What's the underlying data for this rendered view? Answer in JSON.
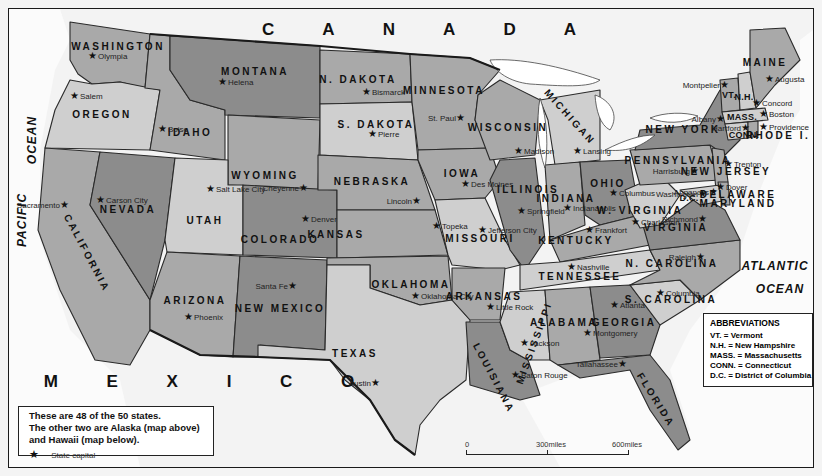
{
  "map": {
    "title": "United States — 48 contiguous states",
    "countries": [
      {
        "id": "canada",
        "label": "C A N A D A",
        "x": 430,
        "y": 30
      },
      {
        "id": "mexico",
        "label": "M E X I C O",
        "x": 210,
        "y": 382
      }
    ],
    "oceans": [
      {
        "id": "pacific-ocean",
        "label": "PACIFIC",
        "x": 22,
        "y": 220,
        "rot": "vert"
      },
      {
        "id": "pacific-ocean-2",
        "label": "OCEAN",
        "x": 32,
        "y": 140,
        "rot": "vert"
      },
      {
        "id": "atlantic-ocean",
        "label": "ATLANTIC",
        "x": 775,
        "y": 266
      },
      {
        "id": "atlantic-ocean-2",
        "label": "OCEAN",
        "x": 780,
        "y": 289
      }
    ],
    "states": [
      {
        "name": "WASHINGTON",
        "x": 118,
        "y": 46,
        "capital": "Olympia",
        "cx": 88,
        "cy": 55,
        "tone": "m"
      },
      {
        "name": "OREGON",
        "x": 102,
        "y": 114,
        "capital": "Salem",
        "cx": 70,
        "cy": 95,
        "tone": "l"
      },
      {
        "name": "CALIFORNIA",
        "x": 87,
        "y": 253,
        "capital": "Sacramento",
        "cx": 64,
        "cy": 204,
        "tone": "m",
        "rot": "diag-ca",
        "cap_left": true
      },
      {
        "name": "IDAHO",
        "x": 190,
        "y": 132,
        "capital": "Boise",
        "cx": 158,
        "cy": 128,
        "tone": "m"
      },
      {
        "name": "NEVADA",
        "x": 128,
        "y": 209,
        "capital": "Carson City",
        "cx": 96,
        "cy": 199,
        "tone": "d"
      },
      {
        "name": "MONTANA",
        "x": 255,
        "y": 71,
        "capital": "Helena",
        "cx": 218,
        "cy": 81,
        "tone": "d"
      },
      {
        "name": "WYOMING",
        "x": 265,
        "y": 175,
        "capital": "Cheyenne",
        "cx": 303,
        "cy": 187,
        "tone": "m",
        "cap_left": true
      },
      {
        "name": "UTAH",
        "x": 205,
        "y": 220,
        "capital": "Salt Lake City",
        "cx": 206,
        "cy": 188,
        "tone": "l",
        "cap_below": true
      },
      {
        "name": "COLORADO",
        "x": 280,
        "y": 239,
        "capital": "Denver",
        "cx": 301,
        "cy": 218,
        "tone": "d"
      },
      {
        "name": "ARIZONA",
        "x": 195,
        "y": 300,
        "capital": "Phoenix",
        "cx": 184,
        "cy": 316,
        "tone": "m"
      },
      {
        "name": "NEW MEXICO",
        "x": 280,
        "y": 308,
        "capital": "Santa Fe",
        "cx": 292,
        "cy": 285,
        "tone": "d",
        "cap_left": true
      },
      {
        "name": "N. DAKOTA",
        "x": 358,
        "y": 79,
        "capital": "Bismarck",
        "cx": 362,
        "cy": 91,
        "tone": "m"
      },
      {
        "name": "S. DAKOTA",
        "x": 376,
        "y": 124,
        "capital": "Pierre",
        "cx": 368,
        "cy": 133,
        "tone": "l"
      },
      {
        "name": "NEBRASKA",
        "x": 372,
        "y": 181,
        "capital": "Lincoln",
        "cx": 416,
        "cy": 200,
        "tone": "m",
        "cap_left": true
      },
      {
        "name": "KANSAS",
        "x": 336,
        "y": 234,
        "capital": "Topeka",
        "cx": 432,
        "cy": 225,
        "tone": "m"
      },
      {
        "name": "OKLAHOMA",
        "x": 411,
        "y": 284,
        "capital": "Oklahoma City",
        "cx": 411,
        "cy": 295,
        "tone": "m",
        "cap_below": true
      },
      {
        "name": "TEXAS",
        "x": 355,
        "y": 353,
        "capital": "Austin",
        "cx": 375,
        "cy": 382,
        "tone": "l",
        "cap_left": true
      },
      {
        "name": "MINNESOTA",
        "x": 444,
        "y": 90,
        "capital": "St. Paul",
        "cx": 460,
        "cy": 117,
        "tone": "m",
        "cap_left": true
      },
      {
        "name": "IOWA",
        "x": 462,
        "y": 173,
        "capital": "Des Moines",
        "cx": 461,
        "cy": 183,
        "tone": "m",
        "cap_below": true
      },
      {
        "name": "MISSOURI",
        "x": 480,
        "y": 238,
        "capital": "Jefferson City",
        "cx": 478,
        "cy": 229,
        "tone": "l"
      },
      {
        "name": "ARKANSAS",
        "x": 484,
        "y": 296,
        "capital": "Little Rock",
        "cx": 486,
        "cy": 306,
        "tone": "m",
        "cap_below": true
      },
      {
        "name": "LOUISIANA",
        "x": 494,
        "y": 378,
        "capital": "Baton Rouge",
        "cx": 511,
        "cy": 374,
        "tone": "d",
        "rot": "diag-la"
      },
      {
        "name": "WISCONSIN",
        "x": 508,
        "y": 127,
        "capital": "Madison",
        "cx": 514,
        "cy": 150,
        "tone": "m"
      },
      {
        "name": "ILLINOIS",
        "x": 528,
        "y": 189,
        "capital": "Springfield",
        "cx": 517,
        "cy": 210,
        "tone": "d"
      },
      {
        "name": "MICHIGAN",
        "x": 570,
        "y": 117,
        "capital": "Lansing",
        "cx": 573,
        "cy": 150,
        "tone": "l",
        "rot": "diag-mi",
        "cap_below": true
      },
      {
        "name": "INDIANA",
        "x": 566,
        "y": 198,
        "capital": "Indianapolis",
        "cx": 563,
        "cy": 207,
        "tone": "m",
        "cap_below": true
      },
      {
        "name": "OHIO",
        "x": 608,
        "y": 183,
        "capital": "Columbus",
        "cx": 609,
        "cy": 192,
        "tone": "d",
        "cap_below": true
      },
      {
        "name": "KENTUCKY",
        "x": 576,
        "y": 240,
        "capital": "Frankfort",
        "cx": 585,
        "cy": 229,
        "tone": "m"
      },
      {
        "name": "TENNESSEE",
        "x": 580,
        "y": 276,
        "capital": "Nashville",
        "cx": 567,
        "cy": 266,
        "tone": "l"
      },
      {
        "name": "MISSISSIPPI",
        "x": 534,
        "y": 343,
        "capital": "Jackson",
        "cx": 520,
        "cy": 342,
        "tone": "l",
        "rot": "diag-ms"
      },
      {
        "name": "ALABAMA",
        "x": 564,
        "y": 322,
        "capital": "Montgomery",
        "cx": 583,
        "cy": 332,
        "tone": "m",
        "cap_below": true
      },
      {
        "name": "GEORGIA",
        "x": 624,
        "y": 322,
        "capital": "Atlanta",
        "cx": 610,
        "cy": 304,
        "tone": "d"
      },
      {
        "name": "FLORIDA",
        "x": 656,
        "y": 400,
        "capital": "Tallahassee",
        "cx": 622,
        "cy": 363,
        "tone": "d",
        "rot": "diag-fl",
        "cap_left": true
      },
      {
        "name": "S. CAROLINA",
        "x": 671,
        "y": 299,
        "capital": "Columbia",
        "cx": 656,
        "cy": 292,
        "tone": "l"
      },
      {
        "name": "N. CAROLINA",
        "x": 672,
        "y": 263,
        "capital": "Raleigh",
        "cx": 700,
        "cy": 256,
        "tone": "m",
        "cap_left": true
      },
      {
        "name": "VIRGINIA",
        "x": 676,
        "y": 227,
        "capital": "Richmond",
        "cx": 702,
        "cy": 218,
        "tone": "d",
        "cap_left": true
      },
      {
        "name": "W. VIRGINIA",
        "x": 640,
        "y": 210,
        "capital": "Charleston",
        "cx": 631,
        "cy": 221,
        "tone": "l"
      },
      {
        "name": "PENNSYLVANIA",
        "x": 678,
        "y": 160,
        "capital": "Harrisburg",
        "cx": 694,
        "cy": 170,
        "tone": "m",
        "cap_left": true
      },
      {
        "name": "NEW YORK",
        "x": 683,
        "y": 129,
        "capital": "Albany",
        "cx": 720,
        "cy": 118,
        "tone": "d",
        "cap_left": true
      },
      {
        "name": "NEW JERSEY",
        "x": 726,
        "y": 171,
        "capital": "Trenton",
        "cx": 724,
        "cy": 163,
        "tone": "m"
      },
      {
        "name": "DELAWARE",
        "x": 738,
        "y": 194,
        "capital": "Dover",
        "cx": 716,
        "cy": 186,
        "tone": "m"
      },
      {
        "name": "MARYLAND",
        "x": 738,
        "y": 203,
        "capital": "Annapolis",
        "cx": 713,
        "cy": 191,
        "tone": "l",
        "cap_left": true
      },
      {
        "name": "D.C.",
        "x": 689,
        "y": 198,
        "capital": "Washington",
        "cx": 702,
        "cy": 193,
        "tone": "d",
        "cap_left": true
      },
      {
        "name": "VT.",
        "x": 729,
        "y": 95,
        "capital": "Montpelier",
        "cx": 724,
        "cy": 84,
        "tone": "m",
        "cap_left": true
      },
      {
        "name": "N.H.",
        "x": 744,
        "y": 97,
        "capital": "Concord",
        "cx": 752,
        "cy": 102,
        "tone": "l"
      },
      {
        "name": "MAINE",
        "x": 765,
        "y": 62,
        "capital": "Augusta",
        "cx": 765,
        "cy": 78,
        "tone": "m"
      },
      {
        "name": "MASS.",
        "x": 742,
        "y": 117,
        "capital": "Boston",
        "cx": 759,
        "cy": 113,
        "tone": "l"
      },
      {
        "name": "CONN.",
        "x": 744,
        "y": 135,
        "capital": "Hartford",
        "cx": 745,
        "cy": 127,
        "tone": "l",
        "cap_left": true
      },
      {
        "name": "RHODE I.",
        "x": 778,
        "y": 135,
        "capital": "Providence",
        "cx": 759,
        "cy": 126,
        "tone": "m"
      }
    ]
  },
  "legend": {
    "lines": [
      "These are 48 of the 50 states.",
      "The other two are Alaska (map above)",
      "and Hawaii (map below)."
    ],
    "key_symbol": "★",
    "key_label": "State capital"
  },
  "abbreviations": {
    "title": "ABBREVIATIONS",
    "items": [
      "VT. = Vermont",
      "N.H. = New Hampshire",
      "MASS. = Massachusetts",
      "CONN. = Connecticut",
      "D.C. = District of Columbia"
    ]
  },
  "scale_bar": {
    "ticks": [
      "0",
      "300miles",
      "600miles"
    ]
  }
}
